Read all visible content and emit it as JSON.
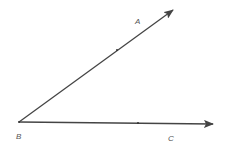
{
  "diagram": {
    "type": "angle",
    "vertex": {
      "label": "B",
      "x": 19,
      "y": 122
    },
    "rays": [
      {
        "name": "BA",
        "label": "A",
        "from": [
          19,
          122
        ],
        "to": [
          173,
          10
        ],
        "tick": [
          117,
          50
        ]
      },
      {
        "name": "BC",
        "label": "C",
        "from": [
          19,
          122
        ],
        "to": [
          213,
          124
        ],
        "tick": [
          138,
          123
        ]
      }
    ],
    "labels": {
      "A": "A",
      "B": "B",
      "C": "C"
    },
    "colors": {
      "line": "#444444",
      "label": "#555555"
    }
  }
}
